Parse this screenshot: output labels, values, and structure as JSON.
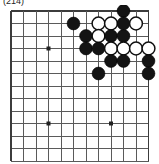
{
  "caption": {
    "text": "(214)"
  },
  "board": {
    "title": "go-board-diagram",
    "type": "go-board",
    "cols": 12,
    "rows": 13,
    "cell_size": 12.5,
    "origin_x": 11,
    "origin_y": 6,
    "colors": {
      "line": "#5a5a5a",
      "edge_line": "#3c3c3c",
      "black_stone": "#141414",
      "white_stone": "#ffffff",
      "stone_outline": "#101010",
      "background": "#ffffff"
    },
    "stone_radius": 6.4,
    "star_points": [
      {
        "col": 3,
        "row": 3
      },
      {
        "col": 3,
        "row": 9
      },
      {
        "col": 8,
        "row": 9
      }
    ],
    "stones": [
      {
        "color": "black",
        "col": 9,
        "row": 0
      },
      {
        "color": "black",
        "col": 5,
        "row": 1
      },
      {
        "color": "white",
        "col": 7,
        "row": 1
      },
      {
        "color": "white",
        "col": 8,
        "row": 1
      },
      {
        "color": "black",
        "col": 9,
        "row": 1
      },
      {
        "color": "white",
        "col": 10,
        "row": 1
      },
      {
        "color": "black",
        "col": 6,
        "row": 2
      },
      {
        "color": "white",
        "col": 7,
        "row": 2
      },
      {
        "color": "black",
        "col": 8,
        "row": 2
      },
      {
        "color": "black",
        "col": 9,
        "row": 2
      },
      {
        "color": "black",
        "col": 6,
        "row": 3
      },
      {
        "color": "black",
        "col": 7,
        "row": 3
      },
      {
        "color": "white",
        "col": 8,
        "row": 3
      },
      {
        "color": "white",
        "col": 9,
        "row": 3
      },
      {
        "color": "white",
        "col": 10,
        "row": 3
      },
      {
        "color": "white",
        "col": 11,
        "row": 3
      },
      {
        "color": "black",
        "col": 8,
        "row": 4
      },
      {
        "color": "black",
        "col": 9,
        "row": 4
      },
      {
        "color": "black",
        "col": 11,
        "row": 4
      },
      {
        "color": "black",
        "col": 7,
        "row": 5
      },
      {
        "color": "black",
        "col": 11,
        "row": 5
      }
    ]
  }
}
